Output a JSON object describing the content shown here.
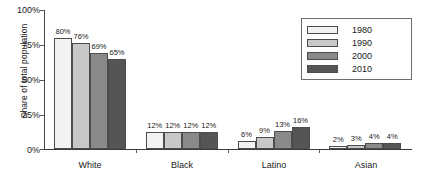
{
  "chart_data": {
    "type": "bar",
    "title": "",
    "xlabel": "",
    "ylabel": "Share of total population",
    "categories": [
      "White",
      "Black",
      "Latino",
      "Asian"
    ],
    "ylim": [
      0,
      100
    ],
    "yticks": [
      "0%",
      "25%",
      "50%",
      "75%",
      "100%"
    ],
    "ytick_values": [
      0,
      25,
      50,
      75,
      100
    ],
    "grid": false,
    "legend_position": "top-right",
    "series": [
      {
        "name": "1980",
        "color": "#f2f2f2",
        "values": [
          80,
          12,
          6,
          2
        ],
        "labels": [
          "80%",
          "12%",
          "6%",
          "2%"
        ]
      },
      {
        "name": "1990",
        "color": "#c8c8c8",
        "values": [
          76,
          12,
          9,
          3
        ],
        "labels": [
          "76%",
          "12%",
          "9%",
          "3%"
        ]
      },
      {
        "name": "2000",
        "color": "#8a8a8a",
        "values": [
          69,
          12,
          13,
          4
        ],
        "labels": [
          "69%",
          "12%",
          "13%",
          "4%"
        ]
      },
      {
        "name": "2010",
        "color": "#555555",
        "values": [
          65,
          12,
          16,
          4
        ],
        "labels": [
          "65%",
          "12%",
          "16%",
          "4%"
        ]
      }
    ]
  },
  "axis": {
    "y_title": "Share of total population",
    "y_ticks": [
      {
        "label": "100%"
      },
      {
        "label": "75%"
      },
      {
        "label": "50%"
      },
      {
        "label": "25%"
      },
      {
        "label": "0%"
      }
    ]
  },
  "legend": {
    "items": [
      {
        "label": "1980"
      },
      {
        "label": "1990"
      },
      {
        "label": "2000"
      },
      {
        "label": "2010"
      }
    ]
  }
}
